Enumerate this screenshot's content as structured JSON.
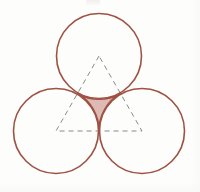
{
  "figure": {
    "caption": "",
    "background_color": "#fdfdfc",
    "width": 200,
    "height": 192
  },
  "style": {
    "circle_stroke_color": "#9e5244",
    "circle_stroke_width": 1.6,
    "circle_fill": "none",
    "triangle_stroke_color": "#8a8a8a",
    "triangle_stroke_width": 1.0,
    "triangle_dash_pattern": "5,4",
    "shaded_region_fill": "#ddb6b0",
    "shaded_region_opacity": 0.95,
    "shaded_region_stroke": "#9e5244"
  },
  "chart_data": {
    "type": "diagram",
    "xlabel": "",
    "ylabel": "",
    "xlim": [
      0,
      200
    ],
    "ylim": [
      0,
      192
    ],
    "grid": false,
    "legend": "none",
    "circles": [
      {
        "name": "top-circle",
        "cx": 99,
        "cy": 56,
        "r": 42.5
      },
      {
        "name": "left-circle",
        "cx": 56,
        "cy": 131,
        "r": 42.5
      },
      {
        "name": "right-circle",
        "cx": 142,
        "cy": 131,
        "r": 42.5
      }
    ],
    "triangle": {
      "name": "equilateral-triangle",
      "vertices": [
        {
          "label": "apex",
          "x": 99,
          "y": 56
        },
        {
          "label": "left",
          "x": 56,
          "y": 131
        },
        {
          "label": "right",
          "x": 142,
          "y": 131
        }
      ],
      "side_length": 86,
      "dashed": true
    },
    "tangent_points": [
      {
        "name": "top-left-tangency",
        "x": 77.5,
        "y": 93.5
      },
      {
        "name": "top-right-tangency",
        "x": 120.5,
        "y": 93.5
      },
      {
        "name": "left-right-tangency",
        "x": 99,
        "y": 131
      }
    ],
    "shaded_region": {
      "name": "curvilinear-triangle",
      "description": "Concave region bounded by the three circular arcs between the tangent points",
      "arc_radius": 42.5,
      "vertices": [
        {
          "x": 77.5,
          "y": 93.5
        },
        {
          "x": 120.5,
          "y": 93.5
        },
        {
          "x": 99,
          "y": 131
        }
      ],
      "fill_color": "#ddb6b0"
    }
  },
  "elements": {
    "top_circle_label": "",
    "left_circle_label": "",
    "right_circle_label": "",
    "shaded_label": ""
  }
}
